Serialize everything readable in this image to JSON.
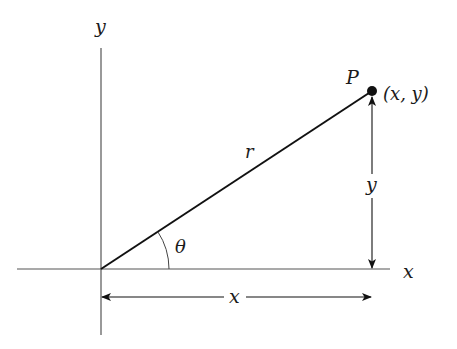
{
  "diagram": {
    "type": "polar-coordinates",
    "axes": {
      "x_label": "x",
      "y_label": "y",
      "origin": [
        101,
        269
      ],
      "x_axis_range": [
        17,
        390
      ],
      "y_axis_range": [
        48,
        335
      ]
    },
    "point": {
      "name": "P",
      "coords_label": "(x, y)",
      "position": [
        372,
        91
      ]
    },
    "segment": {
      "label": "r"
    },
    "angle": {
      "label": "θ",
      "arc_radius": 68
    },
    "dimension_x": {
      "label": "x"
    },
    "dimension_y": {
      "label": "y"
    },
    "colors": {
      "axis": "#555555",
      "line": "#111111",
      "text": "#1a1a1a",
      "background": "#ffffff"
    }
  }
}
